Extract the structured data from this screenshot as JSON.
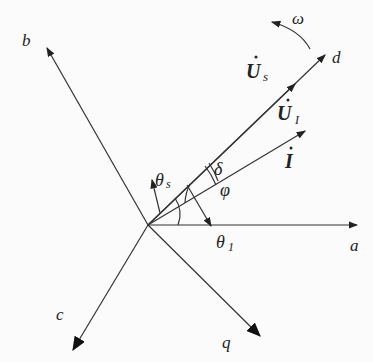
{
  "diagram": {
    "axes": {
      "a": "a",
      "b": "b",
      "c": "c",
      "d": "d",
      "q": "q"
    },
    "phasors": {
      "Us": {
        "symbol": "U",
        "subscript": "s"
      },
      "UI": {
        "symbol": "U",
        "subscript": "I"
      },
      "I": {
        "symbol": "I"
      }
    },
    "angles": {
      "delta": "δ",
      "phi": "φ",
      "theta_s": {
        "symbol": "θ",
        "subscript": "s"
      },
      "theta_1": {
        "symbol": "θ",
        "subscript": "1"
      }
    },
    "rotation": {
      "symbol": "ω"
    }
  }
}
